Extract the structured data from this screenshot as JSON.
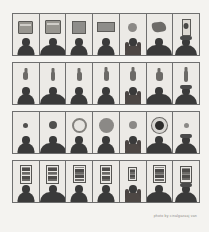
{
  "artwork": {
    "title": "Typology grid of people with objects",
    "background_color": "#f3f2ef",
    "frame_color": "#6f6f6f",
    "cell_background": "#eceae6",
    "silhouette_color": "#3a3a3a",
    "rows_count": 4,
    "columns_count": 7,
    "corner_mark": "+"
  },
  "credit": {
    "text": "photo by cinalgazaaj van"
  },
  "rows": [
    {
      "row_label": "row-1-boxes",
      "object_kind": "rectangular boxes and packages",
      "cells": [
        {
          "object": "grey box",
          "object_type": "box",
          "w": 13,
          "h": 11,
          "person": "standing figure",
          "person_variant": "narrow"
        },
        {
          "object": "stacked package",
          "object_type": "box",
          "w": 14,
          "h": 12,
          "person": "standing figure",
          "person_variant": "wide"
        },
        {
          "object": "dark square panel",
          "object_type": "rect",
          "w": 12,
          "h": 11,
          "person": "standing figure",
          "person_variant": "narrow"
        },
        {
          "object": "wide flat box",
          "object_type": "rect",
          "w": 16,
          "h": 8,
          "person": "standing figure",
          "person_variant": "narrow"
        },
        {
          "object": "round sign",
          "object_type": "disc-gray",
          "w": 9,
          "h": 9,
          "person": "figure with long hair",
          "person_variant": "longhair"
        },
        {
          "object": "irregular bundle",
          "object_type": "blob",
          "w": 14,
          "h": 10,
          "person": "standing figure",
          "person_variant": "wide"
        },
        {
          "object": "tall canister",
          "object_type": "tall",
          "w": 7,
          "h": 15,
          "person": "figure with hat",
          "person_variant": "hat"
        }
      ]
    },
    {
      "row_label": "row-2-vessels",
      "object_kind": "small bottles and vessels",
      "cells": [
        {
          "object": "small flask",
          "object_type": "bottle",
          "w": 5,
          "h": 8,
          "person": "standing figure",
          "person_variant": "narrow"
        },
        {
          "object": "small bottle",
          "object_type": "bottle",
          "w": 4,
          "h": 9,
          "person": "standing figure",
          "person_variant": "wide"
        },
        {
          "object": "dark jar",
          "object_type": "bottle",
          "w": 5,
          "h": 9,
          "person": "standing figure",
          "person_variant": "narrow"
        },
        {
          "object": "capped bottle",
          "object_type": "bottle",
          "w": 5,
          "h": 10,
          "person": "standing figure",
          "person_variant": "narrow"
        },
        {
          "object": "pale jar",
          "object_type": "bottle",
          "w": 6,
          "h": 10,
          "person": "figure with long hair",
          "person_variant": "longhair"
        },
        {
          "object": "round flask",
          "object_type": "bottle",
          "w": 7,
          "h": 9,
          "person": "standing figure",
          "person_variant": "wide"
        },
        {
          "object": "slim bottle",
          "object_type": "bottle",
          "w": 4,
          "h": 11,
          "person": "figure with hat",
          "person_variant": "hat"
        }
      ]
    },
    {
      "row_label": "row-3-circles",
      "object_kind": "circular discs of varying size",
      "cells": [
        {
          "object": "small dark disc",
          "object_type": "disc",
          "w": 5,
          "h": 5,
          "person": "standing figure",
          "person_variant": "narrow"
        },
        {
          "object": "medium dark disc",
          "object_type": "disc",
          "w": 8,
          "h": 8,
          "person": "standing figure",
          "person_variant": "wide"
        },
        {
          "object": "light ring",
          "object_type": "ring",
          "w": 11,
          "h": 11,
          "person": "standing figure",
          "person_variant": "narrow"
        },
        {
          "object": "large grey disc",
          "object_type": "disc-gray",
          "w": 15,
          "h": 15,
          "person": "standing figure",
          "person_variant": "narrow"
        },
        {
          "object": "medium grey disc",
          "object_type": "disc-gray",
          "w": 8,
          "h": 8,
          "person": "figure with long hair",
          "person_variant": "longhair"
        },
        {
          "object": "ringed dark disc",
          "object_type": "disc-ring",
          "w": 9,
          "h": 9,
          "person": "standing figure",
          "person_variant": "wide"
        },
        {
          "object": "small grey disc",
          "object_type": "disc-gray",
          "w": 5,
          "h": 5,
          "person": "figure with hat",
          "person_variant": "hat"
        }
      ]
    },
    {
      "row_label": "row-4-panels",
      "object_kind": "vertical banded panels",
      "cells": [
        {
          "object": "banded panel",
          "object_type": "poster",
          "w": 12,
          "h": 19,
          "person": "standing figure",
          "person_variant": "narrow"
        },
        {
          "object": "banded panel",
          "object_type": "poster",
          "w": 13,
          "h": 19,
          "person": "standing figure",
          "person_variant": "wide"
        },
        {
          "object": "banded panel",
          "object_type": "poster",
          "w": 13,
          "h": 18,
          "person": "standing figure",
          "person_variant": "narrow"
        },
        {
          "object": "banded panel",
          "object_type": "poster",
          "w": 12,
          "h": 19,
          "person": "standing figure",
          "person_variant": "narrow"
        },
        {
          "object": "narrow banded panel",
          "object_type": "poster",
          "w": 9,
          "h": 14,
          "person": "figure with long hair",
          "person_variant": "longhair"
        },
        {
          "object": "banded panel",
          "object_type": "poster",
          "w": 13,
          "h": 18,
          "person": "standing figure",
          "person_variant": "wide"
        },
        {
          "object": "banded panel",
          "object_type": "poster",
          "w": 12,
          "h": 17,
          "person": "figure with hat",
          "person_variant": "hat"
        }
      ]
    }
  ]
}
